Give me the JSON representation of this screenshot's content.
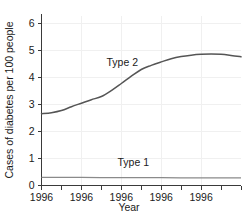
{
  "chart_data": {
    "type": "line",
    "title": "",
    "xlabel": "Year",
    "ylabel": "Cases of diabetes per 100 people",
    "ylim": [
      0,
      6.3
    ],
    "xlim": [
      0,
      10
    ],
    "yticks": [
      "0",
      "1",
      "2",
      "3",
      "4",
      "5",
      "6"
    ],
    "ytick_values": [
      0,
      1,
      2,
      3,
      4,
      5,
      6
    ],
    "xticks": [
      "1996",
      "1996",
      "1996",
      "1996",
      "1996"
    ],
    "xtick_values": [
      0,
      2,
      4,
      6,
      8
    ],
    "minor_xtick_values": [
      0,
      1,
      2,
      3,
      4,
      5,
      6,
      7,
      8,
      9,
      10
    ],
    "grid": true,
    "grid_color": "#f0f0f0",
    "legend": "inline-annotations",
    "series": [
      {
        "name": "Type 2",
        "label": "Type 2",
        "color": "#555555",
        "label_x": 4.05,
        "label_y": 4.42,
        "x": [
          0.0,
          0.5,
          1.0,
          1.5,
          2.0,
          2.5,
          3.0,
          3.5,
          4.0,
          4.5,
          5.0,
          5.5,
          6.0,
          6.5,
          7.0,
          7.5,
          8.0,
          8.5,
          9.0,
          9.5,
          10.0
        ],
        "values": [
          2.66,
          2.7,
          2.78,
          2.92,
          3.05,
          3.18,
          3.3,
          3.52,
          3.78,
          4.05,
          4.3,
          4.45,
          4.58,
          4.7,
          4.78,
          4.83,
          4.86,
          4.87,
          4.86,
          4.82,
          4.77
        ]
      },
      {
        "name": "Type 1",
        "label": "Type 1",
        "color": "#8a8a8a",
        "label_x": 4.6,
        "label_y": 0.72,
        "x": [
          0.0,
          2.0,
          4.0,
          6.0,
          8.0,
          10.0
        ],
        "values": [
          0.3,
          0.3,
          0.29,
          0.29,
          0.28,
          0.28
        ]
      }
    ]
  }
}
